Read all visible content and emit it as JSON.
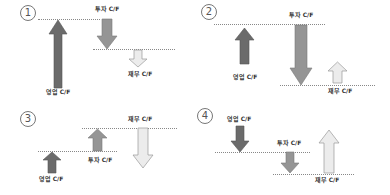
{
  "panels": [
    {
      "number": "1",
      "labels": {
        "operating": "영업 C/F",
        "investing": "투자 C/F",
        "financing": "재무 C/F"
      },
      "directions": {
        "operating": "up",
        "investing": "down",
        "financing": "down"
      }
    },
    {
      "number": "2",
      "labels": {
        "operating": "영업 C/F",
        "investing": "투자 C/F",
        "financing": "재무 C/F"
      },
      "directions": {
        "operating": "up",
        "investing": "down",
        "financing": "up"
      }
    },
    {
      "number": "3",
      "labels": {
        "operating": "영업 C/F",
        "investing": "투자 C/F",
        "financing": "재무 C/F"
      },
      "directions": {
        "operating": "up",
        "investing": "up",
        "financing": "down"
      }
    },
    {
      "number": "4",
      "labels": {
        "operating": "영업 C/F",
        "investing": "투자 C/F",
        "financing": "재무 C/F"
      },
      "directions": {
        "operating": "down",
        "investing": "down",
        "financing": "up"
      }
    }
  ],
  "colors": {
    "operating": "#6b6b6b",
    "investing": "#959595",
    "financing": "#ececec",
    "outline": "#9a9a9a"
  }
}
